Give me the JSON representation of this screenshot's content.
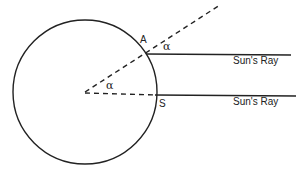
{
  "diagram": {
    "labels": {
      "point_a": "A",
      "point_s": "S",
      "angle_top": "α",
      "angle_center": "α",
      "ray_top": "Sun's Ray",
      "ray_bottom": "Sun's Ray"
    },
    "colors": {
      "stroke": "#222222",
      "background": "#ffffff"
    }
  }
}
